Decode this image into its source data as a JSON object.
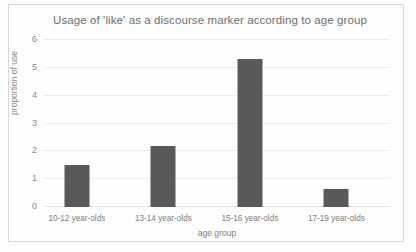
{
  "chart_data": {
    "type": "bar",
    "title": "Usage of 'like' as a discourse marker according to age group",
    "xlabel": "age group",
    "ylabel": "proportion of use",
    "categories": [
      "10-12 year-olds",
      "13-14 year-olds",
      "15-16 year-olds",
      "17-19 year-olds"
    ],
    "values": [
      1.5,
      2.2,
      5.3,
      0.65
    ],
    "ylim": [
      0,
      6
    ],
    "ytick_labels": [
      "0",
      "1",
      "2",
      "3",
      "4",
      "5",
      "6"
    ],
    "ytick_values": [
      0,
      1,
      2,
      3,
      4,
      5,
      6
    ],
    "grid": true,
    "legend": false,
    "bar_color": "#595959",
    "gridline_color": "#ececec",
    "background_color": "#fefefe",
    "text_color": "#7d7d7d"
  }
}
